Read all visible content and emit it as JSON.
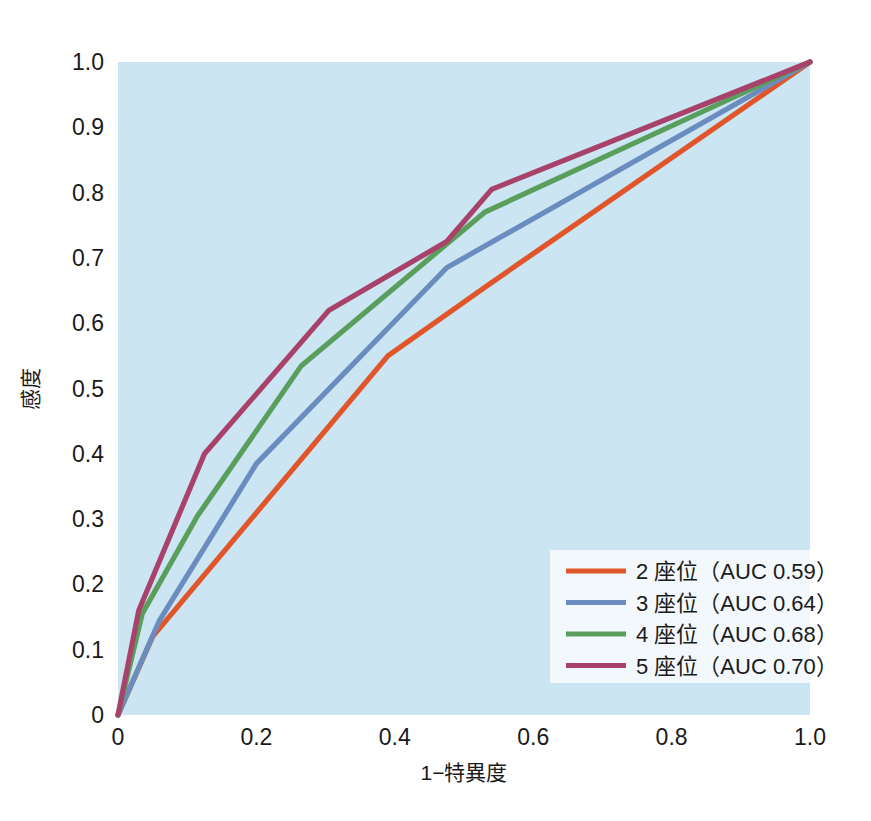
{
  "chart_data": {
    "type": "line",
    "title": "",
    "xlabel": "1−特異度",
    "ylabel": "感度",
    "xlim": [
      0,
      1
    ],
    "ylim": [
      0,
      1
    ],
    "grid": false,
    "plot_background": "#cbe5f3",
    "legend_position": "lower-right",
    "xticks": [
      "0",
      "0.2",
      "0.4",
      "0.6",
      "0.8",
      "1.0"
    ],
    "xtick_values": [
      0,
      0.2,
      0.4,
      0.6,
      0.8,
      1.0
    ],
    "yticks": [
      "0",
      "0.1",
      "0.2",
      "0.3",
      "0.4",
      "0.5",
      "0.6",
      "0.7",
      "0.8",
      "0.9",
      "1.0"
    ],
    "ytick_values": [
      0,
      0.1,
      0.2,
      0.3,
      0.4,
      0.5,
      0.6,
      0.7,
      0.8,
      0.9,
      1.0
    ],
    "series": [
      {
        "name": "2 座位（AUC 0.59）",
        "label_count": "2",
        "auc": 0.59,
        "color": "#e0562a",
        "x": [
          0,
          0.05,
          0.39,
          0.53,
          1.0
        ],
        "y": [
          0,
          0.12,
          0.55,
          0.655,
          1.0
        ]
      },
      {
        "name": "3 座位（AUC 0.64）",
        "label_count": "3",
        "auc": 0.64,
        "color": "#6b8cbe",
        "x": [
          0,
          0.06,
          0.2,
          0.475,
          1.0
        ],
        "y": [
          0,
          0.145,
          0.385,
          0.685,
          1.0
        ]
      },
      {
        "name": "4 座位（AUC 0.68）",
        "label_count": "4",
        "auc": 0.68,
        "color": "#5a9e5d",
        "x": [
          0,
          0.035,
          0.115,
          0.265,
          0.53,
          1.0
        ],
        "y": [
          0,
          0.155,
          0.305,
          0.535,
          0.77,
          1.0
        ]
      },
      {
        "name": "5 座位（AUC 0.70）",
        "label_count": "5",
        "auc": 0.7,
        "color": "#a8426a",
        "x": [
          0,
          0.03,
          0.125,
          0.305,
          0.475,
          0.54,
          1.0
        ],
        "y": [
          0,
          0.16,
          0.4,
          0.62,
          0.725,
          0.805,
          1.0
        ]
      }
    ]
  },
  "legend": {
    "entries": [
      "2 座位（AUC 0.59）",
      "3 座位（AUC 0.64）",
      "4 座位（AUC 0.68）",
      "5 座位（AUC 0.70）"
    ]
  }
}
